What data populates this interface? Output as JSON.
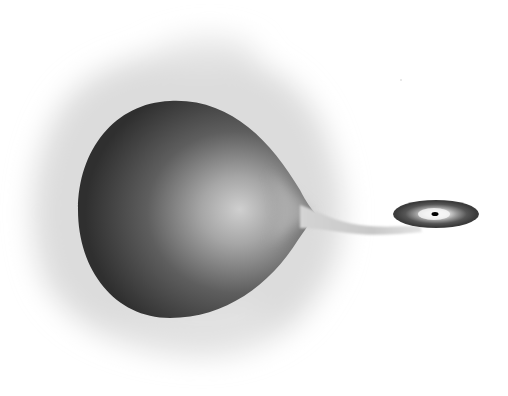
{
  "image": {
    "description": "Illustration of a binary star system: a large star distorted into a teardrop shape by Roche-lobe overflow, with a gas stream flowing to an accretion disk around a compact companion",
    "background_color": "#ffffff",
    "elements": {
      "halo": {
        "label": "diffuse gas halo",
        "color": "#d8d8d8"
      },
      "donor_star": {
        "label": "donor star (teardrop)",
        "highlight_color": "#c8c8c8",
        "shadow_color": "#2e2e2e"
      },
      "mass_stream": {
        "label": "mass transfer stream",
        "color": "#cfcfcf"
      },
      "accretion_disk": {
        "label": "accretion disk",
        "outer_color": "#3a3a3a",
        "inner_color": "#f2f2f2"
      },
      "compact_object": {
        "label": "compact object",
        "color": "#000000"
      }
    }
  }
}
